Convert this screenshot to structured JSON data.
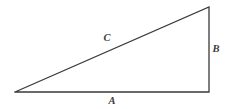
{
  "figure": {
    "name": "right-triangle-labeled-sides",
    "width": 229,
    "height": 109,
    "background_color": "#ffffff",
    "stroke_color": "#3a3a3a",
    "stroke_width": 1.3,
    "text_color": "#3c3c3c"
  },
  "chart_data": {
    "type": "diagram",
    "shape": "right-triangle",
    "title": "",
    "vertices": [
      {
        "name": "left-vertex",
        "x": 15,
        "y": 92
      },
      {
        "name": "bottom-right-vertex",
        "x": 209,
        "y": 92
      },
      {
        "name": "top-right-vertex",
        "x": 209,
        "y": 7
      }
    ],
    "edges": [
      {
        "name": "base",
        "label": "A",
        "from": "left-vertex",
        "to": "bottom-right-vertex"
      },
      {
        "name": "vertical-leg",
        "label": "B",
        "from": "bottom-right-vertex",
        "to": "top-right-vertex"
      },
      {
        "name": "hypotenuse",
        "label": "C",
        "from": "top-right-vertex",
        "to": "left-vertex"
      }
    ],
    "labels": [
      {
        "text": "C",
        "x": 107,
        "y": 38,
        "placement": "above-hypotenuse"
      },
      {
        "text": "B",
        "x": 216,
        "y": 49,
        "placement": "right-of-vertical-leg"
      },
      {
        "text": "A",
        "x": 112,
        "y": 101,
        "placement": "below-base"
      }
    ]
  },
  "annotations": {
    "hypotenuse_label": "C",
    "vertical_leg_label": "B",
    "base_label": "A"
  }
}
